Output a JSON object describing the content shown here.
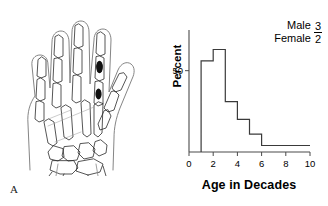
{
  "figure": {
    "panel_a": {
      "label": "A",
      "illustration_name": "hand-skeleton-radiograph",
      "lesion_count": 2,
      "lesion_color": "#111111",
      "outline_color": "#2b2b2b"
    }
  },
  "chart_data": {
    "type": "bar",
    "title": "",
    "subtitle": "",
    "xlabel": "Age in Decades",
    "ylabel": "Percent",
    "categories": [
      "1-2",
      "2-3",
      "3-4",
      "4-5",
      "5-6",
      "6-7",
      "7-8",
      "8-9",
      "9-10"
    ],
    "x": [
      1,
      2,
      3,
      4,
      5,
      6,
      7,
      8,
      9
    ],
    "values": [
      56,
      63,
      31,
      20,
      11,
      4,
      4,
      4,
      4
    ],
    "xlim": [
      0,
      10
    ],
    "ylim": [
      0,
      75
    ],
    "xticks": [
      "0",
      "2",
      "4",
      "6",
      "8",
      "10"
    ],
    "xtick_values": [
      0,
      2,
      4,
      6,
      8,
      10
    ],
    "yticks": [
      "50"
    ],
    "ytick_values": [
      50
    ],
    "grid": false,
    "legend_position": "top-right",
    "annotations": [
      {
        "name": "sex-ratio",
        "numerator_label": "Male",
        "denominator_label": "Female",
        "numerator_value": "3",
        "denominator_value": "2"
      }
    ],
    "line_color": "#3a3a3a",
    "axis_color": "#4a4a4a"
  }
}
